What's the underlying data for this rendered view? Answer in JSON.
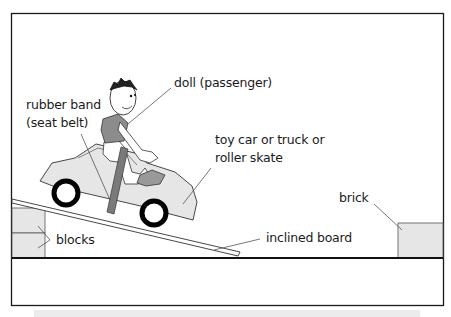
{
  "diagram": {
    "labels": {
      "doll": "doll (passenger)",
      "rubber_band_line1": "rubber band",
      "rubber_band_line2": "(seat belt)",
      "car_line1": "toy car or truck or",
      "car_line2": "roller skate",
      "brick": "brick",
      "blocks": "blocks",
      "board": "inclined board"
    },
    "colors": {
      "frame": "#1a1a1a",
      "fill_light": "#e6e6e6",
      "shirt": "#8c8c8c",
      "belt": "#7a7a7a",
      "wheel": "#000000",
      "strip": "#ececec"
    }
  }
}
